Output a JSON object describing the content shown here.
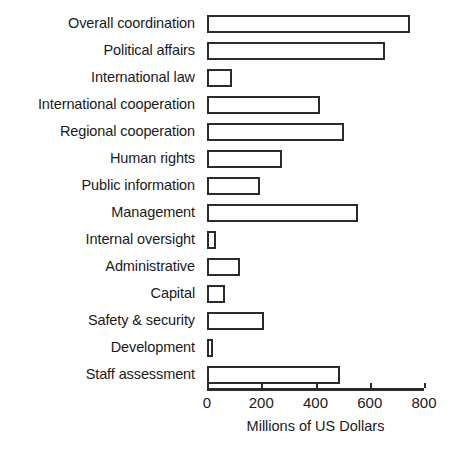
{
  "chart_data": {
    "type": "bar",
    "orientation": "horizontal",
    "title": "",
    "xlabel": "Millions of US Dollars",
    "ylabel": "",
    "xlim": [
      0,
      800
    ],
    "xticks": [
      0,
      200,
      400,
      600,
      800
    ],
    "grid": false,
    "legend": null,
    "categories": [
      "Overall coordination",
      "Political affairs",
      "International law",
      "International cooperation",
      "Regional cooperation",
      "Human rights",
      "Public information",
      "Management",
      "Internal oversight",
      "Administrative",
      "Capital",
      "Safety & security",
      "Development",
      "Staff assessment"
    ],
    "values": [
      750,
      655,
      92,
      415,
      505,
      275,
      195,
      555,
      32,
      120,
      65,
      210,
      22,
      490
    ],
    "units": "Millions of US Dollars"
  },
  "style": {
    "bar_fill": "#ffffff",
    "bar_stroke": "#2b2b2b",
    "axis_color": "#2b2b2b",
    "text_color": "#1a1a1a",
    "background": "#ffffff"
  }
}
